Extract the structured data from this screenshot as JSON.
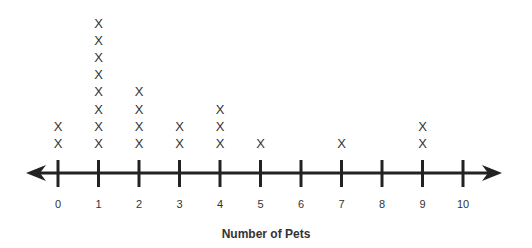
{
  "chart_data": {
    "type": "dot-plot",
    "title": "",
    "xlabel": "Number of Pets",
    "ylabel": "",
    "marker": "X",
    "categories": [
      0,
      1,
      2,
      3,
      4,
      5,
      6,
      7,
      8,
      9,
      10
    ],
    "tick_labels": [
      "0",
      "1",
      "2",
      "3",
      "4",
      "5",
      "6",
      "7",
      "8",
      "9",
      "10"
    ],
    "values": [
      2,
      8,
      4,
      2,
      3,
      1,
      0,
      1,
      0,
      2,
      0
    ],
    "xlim": [
      0,
      10
    ],
    "grid": false,
    "legend": "none",
    "axis_arrows": true
  },
  "colors": {
    "axis": "#222222",
    "marker": "#333333",
    "background": "#ffffff"
  }
}
